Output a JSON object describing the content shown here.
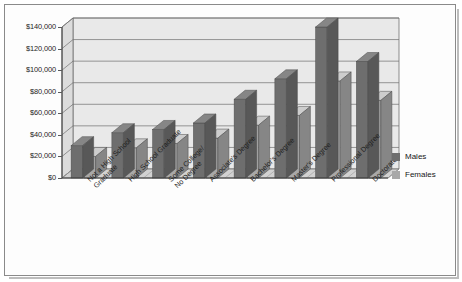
{
  "chart_data": {
    "type": "bar",
    "title": "",
    "subtitle": "",
    "xlabel": "",
    "ylabel": "",
    "ylim": [
      0,
      140000
    ],
    "ytick_step": 20000,
    "grid": true,
    "legend_position": "right",
    "style": "3d-grouped-bar-grayscale",
    "categories": [
      "Not a High School\nGraduate",
      "High School Graduate",
      "Some College/\nNo Degree",
      "Associate's Degree",
      "Bachelor's Degree",
      "Master's Degree",
      "Professional Degree",
      "Doctorate"
    ],
    "ytick_labels": [
      "$0",
      "$20,000",
      "$40,000",
      "$60,000",
      "$80,000",
      "$100,000",
      "$120,000",
      "$140,000"
    ],
    "series": [
      {
        "name": "Males",
        "color": "#6e6e6e",
        "values": [
          30000,
          42000,
          45000,
          51000,
          73000,
          92000,
          140000,
          108000
        ]
      },
      {
        "name": "Females",
        "color": "#a8a8a8",
        "values": [
          20000,
          28000,
          32000,
          37000,
          49000,
          58000,
          90000,
          72000
        ]
      }
    ]
  },
  "legend": {
    "items": [
      {
        "label": "Males",
        "swatch_color": "#6e6e6e"
      },
      {
        "label": "Females",
        "swatch_color": "#a8a8a8"
      }
    ]
  }
}
